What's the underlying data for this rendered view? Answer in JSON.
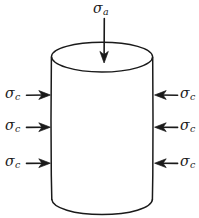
{
  "figure": {
    "background_color": "#ffffff",
    "stroke_color": "#1a1a1a",
    "width": 199,
    "height": 218
  },
  "axial": {
    "symbol": "σ",
    "subscript": "a",
    "arrow_icon": "arrow-down-icon",
    "direction": "down"
  },
  "confining_left": [
    {
      "symbol": "σ",
      "subscript": "c",
      "arrow_icon": "arrow-right-icon",
      "direction": "right"
    },
    {
      "symbol": "σ",
      "subscript": "c",
      "arrow_icon": "arrow-right-icon",
      "direction": "right"
    },
    {
      "symbol": "σ",
      "subscript": "c",
      "arrow_icon": "arrow-right-icon",
      "direction": "right"
    }
  ],
  "confining_right": [
    {
      "symbol": "σ",
      "subscript": "c",
      "arrow_icon": "arrow-left-icon",
      "direction": "left"
    },
    {
      "symbol": "σ",
      "subscript": "c",
      "arrow_icon": "arrow-left-icon",
      "direction": "left"
    },
    {
      "symbol": "σ",
      "subscript": "c",
      "arrow_icon": "arrow-left-icon",
      "direction": "left"
    }
  ],
  "shape": {
    "name": "cylinder",
    "left_edge_x": 51,
    "right_edge_x": 153,
    "top_ellipse_cy": 57,
    "top_ellipse_rx": 51,
    "top_ellipse_ry": 15,
    "bottom_y": 200
  }
}
